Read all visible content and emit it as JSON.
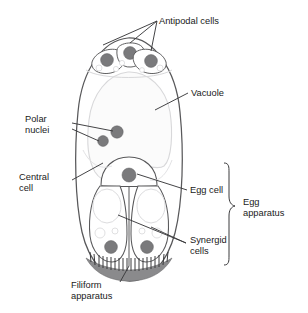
{
  "figure": {
    "background_color": "#ffffff"
  },
  "colors": {
    "outline": "#58585a",
    "inner_outline": "#6e6e70",
    "faint_outline": "#d8d8da",
    "nucleus_fill": "#7a7a7c",
    "nucleus_stroke": "#5e5e60",
    "vacuole_fill": "#fbfbfb",
    "filiform_fill": "#8a8a8c",
    "leader_line": "#3a3a3c",
    "text": "#1a1a1a"
  },
  "labels": {
    "antipodal_cells": {
      "line1": "Antipodal cells",
      "line2": ""
    },
    "vacuole": {
      "line1": "Vacuole",
      "line2": ""
    },
    "polar_nuclei": {
      "line1": "Polar",
      "line2": "nuclei"
    },
    "central_cell": {
      "line1": "Central",
      "line2": "cell"
    },
    "egg_cell": {
      "line1": "Egg cell",
      "line2": ""
    },
    "synergid_cells": {
      "line1": "Synergid",
      "line2": "cells"
    },
    "egg_apparatus": {
      "line1": "Egg",
      "line2": "apparatus"
    },
    "filiform_apparatus": {
      "line1": "Filiform",
      "line2": "apparatus"
    }
  },
  "structures": {
    "antipodal_cell_count": 3,
    "polar_nuclei_count": 2,
    "synergid_cell_count": 2,
    "egg_cell_count": 1
  }
}
